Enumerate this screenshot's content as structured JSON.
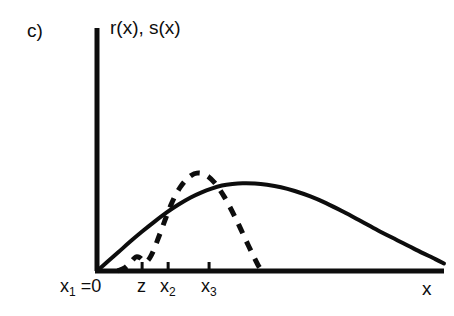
{
  "figure": {
    "panel_label": "c)",
    "y_axis_label": "r(x), s(x)",
    "x_axis_label": "x",
    "background_color": "#ffffff",
    "ink_color": "#0d0d0d"
  },
  "axis": {
    "origin_px": [
      97,
      271
    ],
    "x_end_px": [
      444,
      271
    ],
    "y_top_px": [
      97,
      28
    ],
    "tick_labels": [
      {
        "id": "x1",
        "text_main": "x",
        "text_sub": "1",
        "text_suffix": " =0",
        "x_px": 97
      },
      {
        "id": "z",
        "text_main": "z",
        "text_sub": "",
        "text_suffix": "",
        "x_px": 142
      },
      {
        "id": "x2",
        "text_main": "x",
        "text_sub": "2",
        "text_suffix": "",
        "x_px": 168
      },
      {
        "id": "x3",
        "text_main": "x",
        "text_sub": "3",
        "text_suffix": "",
        "x_px": 209
      }
    ]
  },
  "chart_data": {
    "type": "line",
    "title": "c)",
    "xlabel": "x",
    "ylabel": "r(x), s(x)",
    "grid": false,
    "legend": "none",
    "xlim": [
      0,
      1
    ],
    "ylim": [
      0,
      1
    ],
    "x_tick_labels": [
      "x₁ =0",
      "z",
      "x₂",
      "x₃"
    ],
    "x_tick_positions": [
      0.0,
      0.13,
      0.205,
      0.323
    ],
    "annotations": [
      "x₁ =0 marks the origin of the x axis",
      "z lies between x₁ and x₂",
      "s(x) has a small secondary bump near z",
      "s(x) peak exceeds r(x) peak and lies just past x₃",
      "r(x) has a long right tail approaching zero near the right edge"
    ],
    "series": [
      {
        "name": "r(x)",
        "style": "solid",
        "linewidth": 4,
        "color": "#0d0d0d",
        "x": [
          0.0,
          0.03,
          0.062,
          0.095,
          0.13,
          0.165,
          0.2,
          0.235,
          0.27,
          0.3,
          0.33,
          0.36,
          0.39,
          0.42,
          0.455,
          0.49,
          0.53,
          0.57,
          0.615,
          0.66,
          0.71,
          0.76,
          0.81,
          0.865,
          0.92,
          0.975,
          1.0
        ],
        "y": [
          0.0,
          0.085,
          0.175,
          0.27,
          0.365,
          0.455,
          0.54,
          0.615,
          0.68,
          0.725,
          0.762,
          0.79,
          0.805,
          0.812,
          0.81,
          0.798,
          0.775,
          0.74,
          0.69,
          0.628,
          0.548,
          0.462,
          0.375,
          0.285,
          0.195,
          0.11,
          0.07
        ]
      },
      {
        "name": "s(x)",
        "style": "dashed",
        "linewidth": 5,
        "dash": "10 9",
        "color": "#0d0d0d",
        "x": [
          0.06,
          0.08,
          0.098,
          0.112,
          0.124,
          0.134,
          0.142,
          0.152,
          0.163,
          0.175,
          0.188,
          0.2,
          0.213,
          0.226,
          0.24,
          0.256,
          0.272,
          0.288,
          0.305,
          0.322,
          0.338,
          0.352,
          0.366,
          0.38,
          0.396,
          0.414,
          0.432,
          0.45,
          0.466,
          0.476
        ],
        "y": [
          0.0,
          0.03,
          0.085,
          0.13,
          0.122,
          0.09,
          0.085,
          0.12,
          0.19,
          0.29,
          0.4,
          0.505,
          0.61,
          0.7,
          0.775,
          0.84,
          0.885,
          0.905,
          0.9,
          0.87,
          0.82,
          0.76,
          0.69,
          0.61,
          0.51,
          0.39,
          0.265,
          0.145,
          0.045,
          0.0
        ]
      }
    ]
  }
}
